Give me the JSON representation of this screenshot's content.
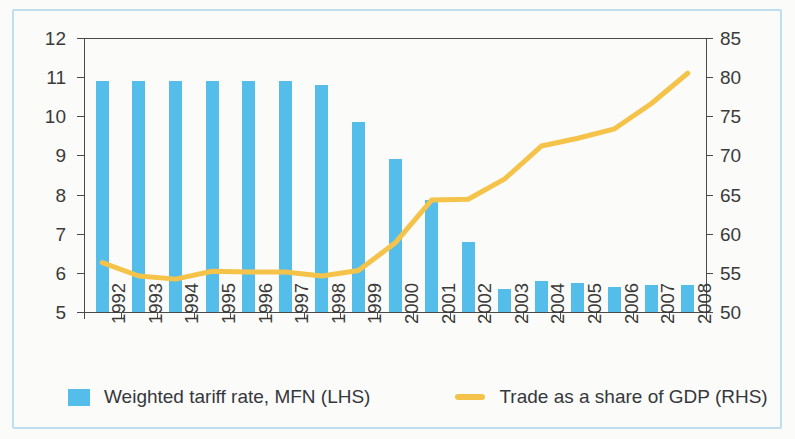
{
  "chart_data": {
    "type": "bar",
    "title": "",
    "subtitle": "",
    "xlabel": "",
    "ylabel": "",
    "grid": false,
    "legend_position": "bottom",
    "categories": [
      "1992",
      "1993",
      "1994",
      "1995",
      "1996",
      "1997",
      "1998",
      "1999",
      "2000",
      "2001",
      "2002",
      "2003",
      "2004",
      "2005",
      "2006",
      "2007",
      "2008"
    ],
    "axes": {
      "left": {
        "label": "Weighted tariff rate, MFN (LHS)",
        "min": 5,
        "max": 12,
        "step": 1,
        "ticks": [
          "5",
          "6",
          "7",
          "8",
          "9",
          "10",
          "11",
          "12"
        ]
      },
      "right": {
        "label": "Trade as a share of GDP (RHS)",
        "min": 50,
        "max": 85,
        "step": 5,
        "ticks": [
          "50",
          "55",
          "60",
          "65",
          "70",
          "75",
          "80",
          "85"
        ]
      }
    },
    "series": [
      {
        "name": "Weighted tariff rate, MFN (LHS)",
        "type": "bar",
        "axis": "left",
        "color": "#55bdea",
        "values": [
          10.9,
          10.9,
          10.9,
          10.9,
          10.9,
          10.9,
          10.8,
          9.85,
          8.9,
          7.85,
          6.8,
          5.6,
          5.8,
          5.75,
          5.65,
          5.7,
          5.7
        ]
      },
      {
        "name": "Trade as a share of GDP (RHS)",
        "type": "line",
        "axis": "right",
        "color": "#f5c34a",
        "values": [
          56.3,
          54.6,
          54.2,
          55.2,
          55.1,
          55.1,
          54.6,
          55.3,
          58.8,
          64.3,
          64.4,
          67.0,
          71.2,
          72.2,
          73.4,
          76.6,
          80.5
        ]
      }
    ]
  },
  "legend": {
    "entries": [
      {
        "label": "Weighted tariff rate, MFN (LHS)",
        "marker": "bar-swatch",
        "color": "#55bdea"
      },
      {
        "label": "Trade as a share of GDP (RHS)",
        "marker": "line-swatch",
        "color": "#f5c34a"
      }
    ]
  }
}
